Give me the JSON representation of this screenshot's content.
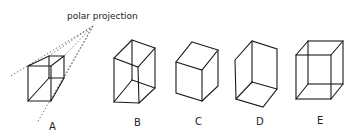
{
  "annotation": {
    "text": "polar projection"
  },
  "figures": [
    {
      "id": "A",
      "label": "A",
      "description": "cube with polar projection lines converging to a point"
    },
    {
      "id": "B",
      "label": "B",
      "description": "transparent cube, alternate orientation"
    },
    {
      "id": "C",
      "label": "C",
      "description": "opaque cube viewed from above"
    },
    {
      "id": "D",
      "label": "D",
      "description": "cube viewed from below (inside corner)"
    },
    {
      "id": "E",
      "label": "E",
      "description": "transparent wireframe cube (Necker cube)"
    }
  ],
  "colors": {
    "line": "#1a1a1a",
    "projection": "#555555",
    "background": "#ffffff"
  }
}
